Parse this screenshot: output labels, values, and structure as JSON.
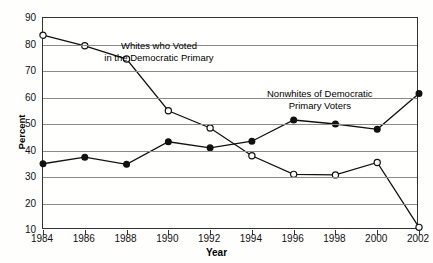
{
  "chart_data": {
    "type": "line",
    "title": "",
    "xlabel": "Year",
    "ylabel": "Percent",
    "x": [
      1984,
      1986,
      1988,
      1990,
      1992,
      1994,
      1996,
      1998,
      2000,
      2002
    ],
    "xticklabels": [
      "1984",
      "1986",
      "1988",
      "1990",
      "1992",
      "1994",
      "1996",
      "1998",
      "2000",
      "2002"
    ],
    "yticklabels": [
      "10",
      "20",
      "30",
      "40",
      "50",
      "60",
      "70",
      "80",
      "90"
    ],
    "yticks": [
      10,
      20,
      30,
      40,
      50,
      60,
      70,
      80,
      90
    ],
    "ylim": [
      10,
      90
    ],
    "xlim": [
      1984,
      2002
    ],
    "grid": "horizontal",
    "legend": "inline-annotations",
    "series": [
      {
        "name": "Whites who Voted in the Democratic Primary",
        "marker": "open-circle",
        "values": [
          83.5,
          79.5,
          74.5,
          55.0,
          48.5,
          38.0,
          31.0,
          30.8,
          35.5,
          11.0
        ]
      },
      {
        "name": "Nonwhites of Democratic Primary Voters",
        "marker": "filled-circle",
        "values": [
          35.0,
          37.5,
          34.8,
          43.3,
          41.0,
          43.5,
          51.5,
          50.0,
          48.0,
          61.5
        ]
      }
    ],
    "annotations": [
      {
        "id": "whites-label",
        "line1": "Whites who Voted",
        "line2": "in the Democratic Primary"
      },
      {
        "id": "nonwhites-label",
        "line1": "Nonwhites of Democratic",
        "line2": "Primary Voters"
      }
    ]
  }
}
